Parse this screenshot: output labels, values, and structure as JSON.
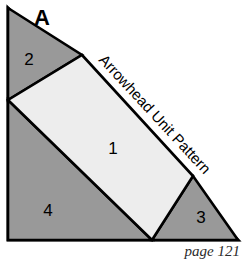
{
  "figure": {
    "panel_letter": "A",
    "caption": "Arrowhead Unit Pattern",
    "page_note": "page 121",
    "canvas": {
      "width": 246,
      "height": 259
    },
    "colors": {
      "background": "#ffffff",
      "shaded_region": "#999999",
      "light_region": "#ededed",
      "outline": "#000000",
      "page_note_text": "#2b2b2b"
    },
    "outer_shape": {
      "name": "right-triangle",
      "points": "8,8 8,240 238,240"
    },
    "regions": [
      {
        "id": "1",
        "label": "1",
        "shape": "quadrilateral",
        "fill": "#ededed",
        "points": "82,55 193,176 152,240 8,100",
        "label_x": 113,
        "label_y": 150
      },
      {
        "id": "2",
        "label": "2",
        "shape": "triangle",
        "fill": "#999999",
        "points": "8,8 82,55 8,100",
        "label_x": 29,
        "label_y": 61
      },
      {
        "id": "3",
        "label": "3",
        "shape": "triangle",
        "fill": "#999999",
        "points": "193,176 238,240 152,240",
        "label_x": 201,
        "label_y": 219
      },
      {
        "id": "4",
        "label": "4",
        "shape": "triangle",
        "fill": "#999999",
        "points": "8,100 152,240 8,240",
        "label_x": 48,
        "label_y": 212
      }
    ],
    "panel_letter_pos": {
      "x": 42,
      "y": 19
    },
    "caption_path": {
      "x1": 92,
      "y1": 48,
      "x2": 216,
      "y2": 182
    },
    "page_note_pos": {
      "x": 240,
      "y": 256
    }
  }
}
